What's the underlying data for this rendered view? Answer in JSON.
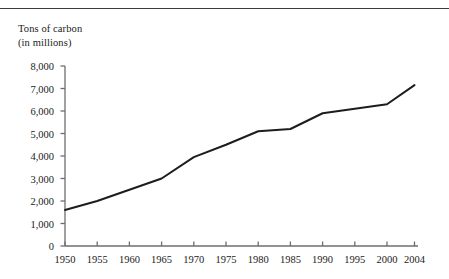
{
  "figure": {
    "axis_title_line1": "Tons of carbon",
    "axis_title_line2": "(in millions)",
    "line_color": "#1d1d1f",
    "axis_color": "#6e6e72",
    "rule_color": "#3a3a3c",
    "background": "#ffffff"
  },
  "chart_data": {
    "type": "line",
    "title": "Tons of carbon (in millions)",
    "xlabel": "",
    "ylabel": "Tons of carbon (in millions)",
    "grid": false,
    "legend": "none",
    "xlim": [
      1950,
      2004
    ],
    "ylim": [
      0,
      8000
    ],
    "x": [
      1950,
      1955,
      1960,
      1965,
      1970,
      1975,
      1980,
      1985,
      1990,
      1995,
      2000,
      2004
    ],
    "values": [
      1600,
      2000,
      2500,
      3000,
      3950,
      4500,
      5100,
      5200,
      5900,
      6100,
      6300,
      7150
    ],
    "categories": [
      "1950",
      "1955",
      "1960",
      "1965",
      "1970",
      "1975",
      "1980",
      "1985",
      "1990",
      "1995",
      "2000",
      "2004"
    ],
    "xtick_labels": [
      "1950",
      "1955",
      "1960",
      "1965",
      "1970",
      "1975",
      "1980",
      "1985",
      "1990",
      "1995",
      "2000",
      "2004"
    ],
    "ytick_values": [
      0,
      1000,
      2000,
      3000,
      4000,
      5000,
      6000,
      7000,
      8000
    ],
    "ytick_labels": [
      "0",
      "1,000",
      "2,000",
      "3,000",
      "4,000",
      "5,000",
      "6,000",
      "7,000",
      "8,000"
    ]
  }
}
